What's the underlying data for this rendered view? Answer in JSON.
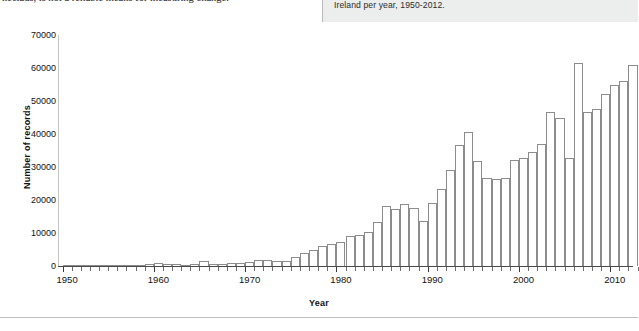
{
  "document_strip": {
    "left_column_clipped_text": "hectads, is not a reliable means for measuring change.",
    "right_caption_text": "Ireland per year, 1950-2012.",
    "right_panel_color": "#eceded"
  },
  "chart_data": {
    "type": "bar",
    "title": "",
    "xlabel": "Year",
    "ylabel": "Number of records",
    "ylim": [
      0,
      70000
    ],
    "ytick_labels": [
      "0",
      "10000",
      "20000",
      "30000",
      "40000",
      "50000",
      "60000",
      "70000"
    ],
    "ytick_values": [
      0,
      10000,
      20000,
      30000,
      40000,
      50000,
      60000,
      70000
    ],
    "xlim": [
      1949.5,
      2012.5
    ],
    "xtick_labels": [
      "1950",
      "1960",
      "1970",
      "1980",
      "1990",
      "2000",
      "2010"
    ],
    "xtick_values": [
      1950,
      1960,
      1970,
      1980,
      1990,
      2000,
      2010
    ],
    "grid": false,
    "legend": "none",
    "bar_color": "#ffffff",
    "bar_edge_color": "#8c8c8c",
    "categories": [
      1950,
      1951,
      1952,
      1953,
      1954,
      1955,
      1956,
      1957,
      1958,
      1959,
      1960,
      1961,
      1962,
      1963,
      1964,
      1965,
      1966,
      1967,
      1968,
      1969,
      1970,
      1971,
      1972,
      1973,
      1974,
      1975,
      1976,
      1977,
      1978,
      1979,
      1980,
      1981,
      1982,
      1983,
      1984,
      1985,
      1986,
      1987,
      1988,
      1989,
      1990,
      1991,
      1992,
      1993,
      1994,
      1995,
      1996,
      1997,
      1998,
      1999,
      2000,
      2001,
      2002,
      2003,
      2004,
      2005,
      2006,
      2007,
      2008,
      2009,
      2010,
      2011,
      2012
    ],
    "values": [
      300,
      250,
      300,
      350,
      300,
      400,
      350,
      400,
      450,
      500,
      900,
      700,
      500,
      450,
      500,
      1400,
      600,
      700,
      800,
      900,
      1100,
      1700,
      1800,
      1600,
      1600,
      2600,
      3800,
      5000,
      6200,
      6700,
      7400,
      9100,
      9500,
      10300,
      13300,
      18300,
      17200,
      18700,
      17600,
      13700,
      19000,
      23400,
      29100,
      36800,
      40600,
      31800,
      26600,
      26500,
      26700,
      32100,
      32600,
      34400,
      36900,
      46700,
      44900,
      32700,
      61500,
      46800,
      47500,
      52000,
      55000,
      56200,
      60800
    ]
  }
}
